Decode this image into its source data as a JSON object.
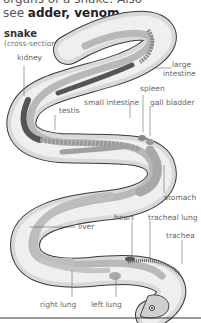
{
  "intro": {
    "line1": "organs of a snake. Also",
    "see_prefix": "see ",
    "link1": "adder",
    "sep": ", ",
    "link2": "venom",
    "end": "."
  },
  "diagram": {
    "title": "snake",
    "subtitle": "(cross-section)",
    "labels": {
      "kidney": "kidney",
      "large_intestine_1": "large",
      "large_intestine_2": "intestine",
      "spleen": "spleen",
      "small_intestine": "small intestine",
      "gall_bladder": "gall bladder",
      "testis": "testis",
      "stomach": "stomach",
      "heart": "heart",
      "tracheal_lung": "tracheal lung",
      "trachea": "trachea",
      "liver": "liver",
      "right_lung": "right lung",
      "left_lung": "left lung"
    },
    "colors": {
      "body_outer": "#d9d9d9",
      "body_inner": "#efefef",
      "organ_dark": "#555555",
      "organ_mid": "#a8a8a8",
      "organ_light": "#c8c8c8",
      "leader": "#666666"
    }
  }
}
